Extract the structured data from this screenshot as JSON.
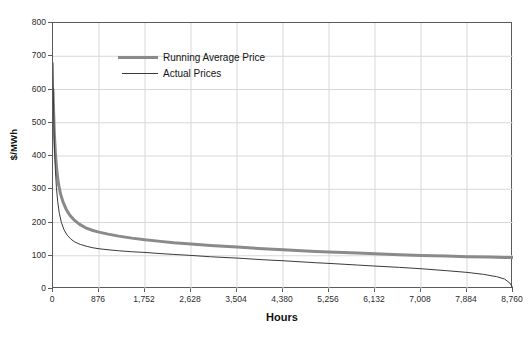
{
  "chart_data": {
    "type": "line",
    "title": "",
    "xlabel": "Hours",
    "ylabel": "$/MWh",
    "xlim": [
      0,
      8760
    ],
    "ylim": [
      0,
      800
    ],
    "grid": true,
    "legend_position": "upper-left-inside",
    "x_tick_labels": [
      "0",
      "876",
      "1,752",
      "2,628",
      "3,504",
      "4,380",
      "5,256",
      "6,132",
      "7,008",
      "7,884",
      "8,760"
    ],
    "x_tick_values": [
      0,
      876,
      1752,
      2628,
      3504,
      4380,
      5256,
      6132,
      7008,
      7884,
      8760
    ],
    "y_tick_labels": [
      "0",
      "100",
      "200",
      "300",
      "400",
      "500",
      "600",
      "700",
      "800"
    ],
    "y_tick_values": [
      0,
      100,
      200,
      300,
      400,
      500,
      600,
      700,
      800
    ],
    "series": [
      {
        "name": "Running Average Price",
        "color": "#8a8a8a",
        "width": 3,
        "x": [
          0,
          10,
          25,
          45,
          70,
          100,
          140,
          190,
          250,
          320,
          400,
          500,
          620,
          760,
          876,
          1050,
          1250,
          1500,
          1752,
          2000,
          2300,
          2628,
          3000,
          3504,
          4000,
          4380,
          5000,
          5256,
          5800,
          6132,
          6600,
          7008,
          7500,
          7884,
          8300,
          8600,
          8760
        ],
        "y": [
          600,
          540,
          470,
          410,
          360,
          320,
          288,
          262,
          240,
          222,
          208,
          195,
          184,
          176,
          171,
          165,
          159,
          153,
          148,
          144,
          139,
          135,
          131,
          126,
          121,
          118,
          113,
          111,
          108,
          106,
          103,
          101,
          99,
          97,
          96,
          95,
          95
        ]
      },
      {
        "name": "Actual Prices",
        "color": "#3a3a3a",
        "width": 1,
        "x": [
          0,
          8,
          18,
          30,
          45,
          65,
          90,
          120,
          160,
          210,
          270,
          340,
          420,
          520,
          650,
          760,
          876,
          1050,
          1250,
          1500,
          1752,
          2000,
          2300,
          2628,
          3000,
          3504,
          4000,
          4380,
          5000,
          5256,
          5800,
          6132,
          6600,
          7008,
          7500,
          7884,
          8200,
          8450,
          8600,
          8700,
          8760
        ],
        "y": [
          680,
          580,
          490,
          420,
          360,
          305,
          262,
          228,
          200,
          178,
          162,
          150,
          141,
          134,
          128,
          124,
          121,
          118,
          115,
          112,
          110,
          107,
          104,
          101,
          97,
          93,
          88,
          85,
          79,
          77,
          72,
          69,
          65,
          61,
          55,
          50,
          44,
          37,
          30,
          18,
          3
        ]
      }
    ]
  },
  "legend": {
    "items": [
      {
        "label": "Running Average Price",
        "style": "thick-gray"
      },
      {
        "label": "Actual Prices",
        "style": "thin-black"
      }
    ]
  },
  "axes": {
    "x_title": "Hours",
    "y_title": "$/MWh"
  }
}
